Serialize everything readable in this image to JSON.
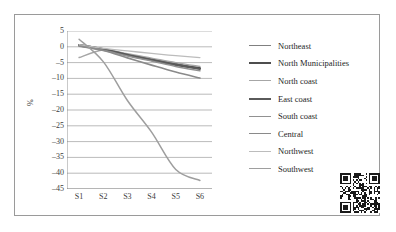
{
  "figure": {
    "border_color": "#9a9a9a",
    "background": "#ffffff"
  },
  "y_axis_title": "%",
  "qr_code": {
    "name": "qr-code",
    "description": "qr-code-image"
  },
  "chart_data": {
    "type": "line",
    "title": "",
    "xlabel": "",
    "ylabel": "%",
    "categories": [
      "S1",
      "S2",
      "S3",
      "S4",
      "S5",
      "S6"
    ],
    "yticks": [
      5,
      0,
      -5,
      -10,
      -15,
      -20,
      -25,
      -30,
      -35,
      -40,
      -45
    ],
    "ylim": [
      -45,
      5
    ],
    "grid": "horizontal",
    "legend_position": "right",
    "series": [
      {
        "name": "Northeast",
        "color": "#808080",
        "width": 1.4,
        "values": [
          0.4,
          -0.9,
          -2.4,
          -3.9,
          -5.3,
          -6.6
        ]
      },
      {
        "name": "North Municipalities",
        "color": "#4d4d4d",
        "width": 2.2,
        "values": [
          0.5,
          -0.8,
          -2.6,
          -4.2,
          -5.7,
          -6.8
        ]
      },
      {
        "name": "North coast",
        "color": "#a6a6a6",
        "width": 1.4,
        "values": [
          -3.4,
          -1.0,
          -2.2,
          -3.6,
          -5.0,
          -6.2
        ]
      },
      {
        "name": "East coast",
        "color": "#5a5a5a",
        "width": 2.0,
        "values": [
          0.6,
          -0.7,
          -2.5,
          -4.1,
          -5.6,
          -7.0
        ]
      },
      {
        "name": "South coast",
        "color": "#919191",
        "width": 1.5,
        "values": [
          0.3,
          -1.1,
          -2.9,
          -4.5,
          -6.2,
          -7.6
        ]
      },
      {
        "name": "Central",
        "color": "#8a8a8a",
        "width": 1.6,
        "values": [
          0.2,
          -1.2,
          -3.5,
          -5.8,
          -8.0,
          -9.9
        ]
      },
      {
        "name": "Northwest",
        "color": "#bcbcbc",
        "width": 1.3,
        "values": [
          0.7,
          -0.5,
          -1.3,
          -2.1,
          -2.8,
          -3.4
        ]
      },
      {
        "name": "Southwest",
        "color": "#9e9e9e",
        "width": 1.5,
        "values": [
          2.4,
          -4.7,
          -17.0,
          -27.0,
          -38.8,
          -42.3
        ]
      }
    ]
  }
}
